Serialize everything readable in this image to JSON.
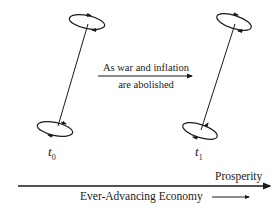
{
  "diagram": {
    "nodes": [
      {
        "id": "top-t0",
        "label": "t",
        "subscript": "0"
      },
      {
        "id": "top-t1",
        "label": "t",
        "subscript": "1"
      }
    ],
    "transition": {
      "line1": "As war and inflation",
      "line2": "are abolished"
    },
    "axis": {
      "label_above": "Prosperity",
      "label_below": "Ever-Advancing Economy"
    },
    "colors": {
      "stroke": "#1a1a1a",
      "background": "#ffffff"
    }
  }
}
